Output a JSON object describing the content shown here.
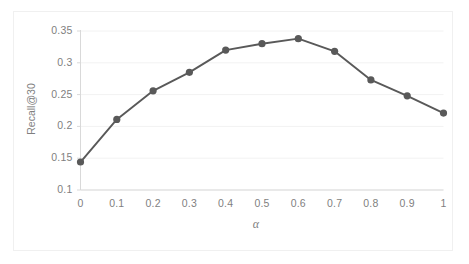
{
  "chart_data": {
    "type": "line",
    "title": "",
    "xlabel": "α",
    "ylabel": "Recall@30",
    "x": [
      0,
      0.1,
      0.2,
      0.3,
      0.4,
      0.5,
      0.6,
      0.7,
      0.8,
      0.9,
      1
    ],
    "values": [
      0.144,
      0.211,
      0.256,
      0.285,
      0.32,
      0.33,
      0.338,
      0.318,
      0.273,
      0.248,
      0.221
    ],
    "series": [
      {
        "name": "Recall@30",
        "values": [
          0.144,
          0.211,
          0.256,
          0.285,
          0.32,
          0.33,
          0.338,
          0.318,
          0.273,
          0.248,
          0.221
        ]
      }
    ],
    "xlim": [
      0,
      1
    ],
    "ylim": [
      0.1,
      0.35
    ],
    "ytick_labels": [
      "0.35",
      "0.3",
      "0.25",
      "0.2",
      "0.15",
      "0.1"
    ],
    "ytick_values": [
      0.35,
      0.3,
      0.25,
      0.2,
      0.15,
      0.1
    ],
    "xtick_labels": [
      "0",
      "0.1",
      "0.2",
      "0.3",
      "0.4",
      "0.5",
      "0.6",
      "0.7",
      "0.8",
      "0.9",
      "1"
    ],
    "xtick_values": [
      0,
      0.1,
      0.2,
      0.3,
      0.4,
      0.5,
      0.6,
      0.7,
      0.8,
      0.9,
      1
    ],
    "grid": "horizontal",
    "legend": "none",
    "marker": "circle",
    "line_color": "#595959",
    "marker_color": "#595959",
    "gridline_color": "#f2f2f2",
    "axis_color": "#d9d9d9",
    "tick_label_color": "#7f7f7f",
    "background_color": "#ffffff"
  }
}
